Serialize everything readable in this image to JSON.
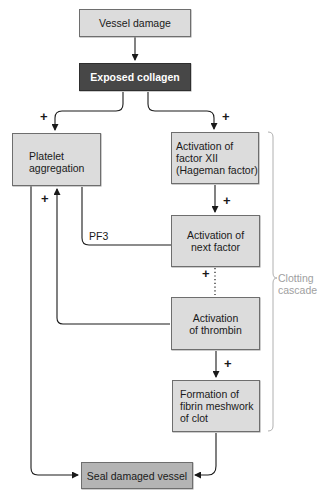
{
  "diagram": {
    "nodes": {
      "vessel_damage": "Vessel damage",
      "exposed_collagen": "Exposed collagen",
      "platelet_aggregation": "Platelet\naggregation",
      "factor_xii": "Activation of\nfactor XII\n(Hageman factor)",
      "next_factor": "Activation of\nnext factor",
      "thrombin": "Activation\nof thrombin",
      "fibrin": "Formation of\nfibrin meshwork\nof clot",
      "seal": "Seal damaged vessel"
    },
    "edge_labels": {
      "plus": "+",
      "pf3": "PF3"
    },
    "bracket_label": "Clotting\ncascade",
    "colors": {
      "box_fill": "#dcdcdc",
      "dark_box_fill": "#474747",
      "seal_box_fill": "#b4b4b4",
      "line": "#1a1a1a",
      "bracket": "#b0b0b0"
    }
  }
}
